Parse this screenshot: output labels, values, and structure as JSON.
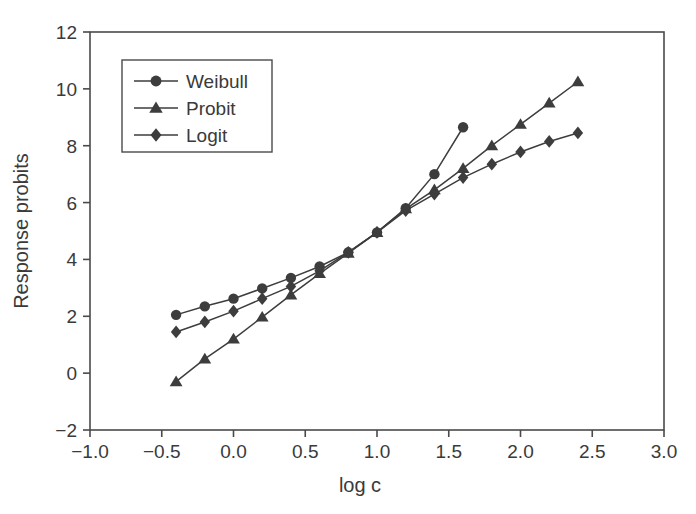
{
  "chart_data": {
    "type": "line",
    "title": "",
    "xlabel": "log c",
    "ylabel": "Response probits",
    "xlim": [
      -1.0,
      3.0
    ],
    "ylim": [
      -2,
      12
    ],
    "xticks": [
      -1.0,
      -0.5,
      0.0,
      0.5,
      1.0,
      1.5,
      2.0,
      2.5,
      3.0
    ],
    "xtick_labels": [
      "−1.0",
      "−0.5",
      "0.0",
      "0.5",
      "1.0",
      "1.5",
      "2.0",
      "2.5",
      "3.0"
    ],
    "yticks": [
      -2,
      0,
      2,
      4,
      6,
      8,
      10,
      12
    ],
    "ytick_labels": [
      "−2",
      "0",
      "2",
      "4",
      "6",
      "8",
      "10",
      "12"
    ],
    "grid": false,
    "legend_position": "upper-left",
    "marker_color": "#3d3d3d",
    "line_color": "#3d3d3d",
    "series": [
      {
        "name": "Weibull",
        "marker": "circle",
        "x": [
          -0.4,
          -0.2,
          0.0,
          0.2,
          0.4,
          0.6,
          0.8,
          1.0,
          1.2,
          1.4,
          1.6
        ],
        "values": [
          2.05,
          2.35,
          2.62,
          2.98,
          3.35,
          3.75,
          4.25,
          4.95,
          5.8,
          7.0,
          8.65
        ]
      },
      {
        "name": "Probit",
        "marker": "triangle",
        "x": [
          -0.4,
          -0.2,
          0.0,
          0.2,
          0.4,
          0.6,
          0.8,
          1.0,
          1.2,
          1.4,
          1.6,
          1.8,
          2.0,
          2.2,
          2.4
        ],
        "values": [
          -0.3,
          0.5,
          1.2,
          1.97,
          2.75,
          3.5,
          4.22,
          4.95,
          5.78,
          6.45,
          7.2,
          8.0,
          8.75,
          9.5,
          10.25
        ]
      },
      {
        "name": "Logit",
        "marker": "diamond",
        "x": [
          -0.4,
          -0.2,
          0.0,
          0.2,
          0.4,
          0.6,
          0.8,
          1.0,
          1.2,
          1.4,
          1.6,
          1.8,
          2.0,
          2.2,
          2.4
        ],
        "values": [
          1.45,
          1.8,
          2.18,
          2.62,
          3.05,
          3.6,
          4.25,
          4.95,
          5.72,
          6.3,
          6.88,
          7.35,
          7.78,
          8.15,
          8.45
        ]
      }
    ]
  },
  "legend": {
    "items": [
      {
        "label": "Weibull",
        "marker": "circle"
      },
      {
        "label": "Probit",
        "marker": "triangle"
      },
      {
        "label": "Logit",
        "marker": "diamond"
      }
    ]
  }
}
